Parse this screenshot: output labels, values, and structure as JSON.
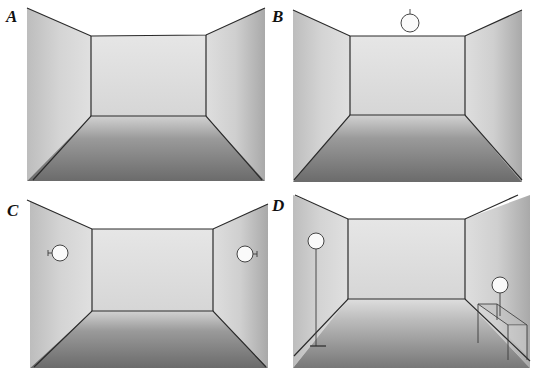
{
  "figure": {
    "panels": [
      {
        "id": "A",
        "label": "A",
        "lighting": "none",
        "lamps": []
      },
      {
        "id": "B",
        "label": "B",
        "lighting": "ceiling pendant",
        "lamps": [
          "pendant-lamp"
        ]
      },
      {
        "id": "C",
        "label": "C",
        "lighting": "wall sconces",
        "lamps": [
          "wall-sconce-left",
          "wall-sconce-right"
        ]
      },
      {
        "id": "D",
        "label": "D",
        "lighting": "floor lamp and table lamp",
        "lamps": [
          "floor-lamp",
          "table-lamp"
        ],
        "furniture": [
          "table"
        ]
      }
    ]
  },
  "colors": {
    "line": "#2a2a2a",
    "wall_light": "#e2e2e2",
    "wall_mid": "#bdbdbd",
    "floor_light": "#c9c9c9",
    "floor_dark": "#6e6e6e",
    "lamp_fill": "#fafafa"
  }
}
